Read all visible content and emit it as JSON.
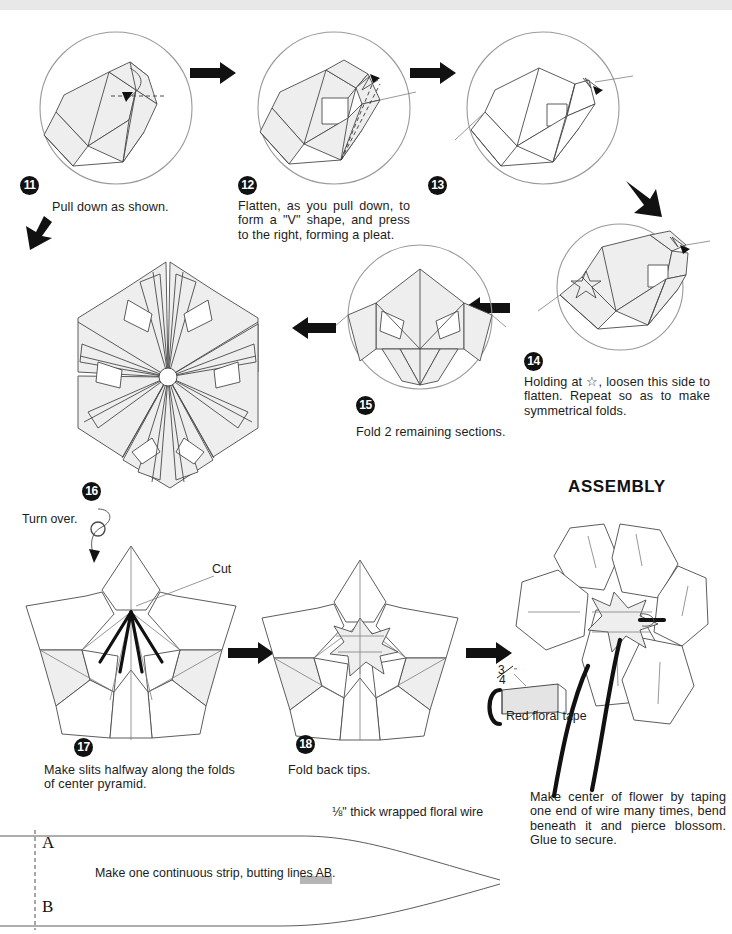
{
  "document": {
    "title": "Origami flower folding instructions — steps 11 to 18 and assembly"
  },
  "steps": [
    {
      "id": "11",
      "number": "11",
      "caption": "Pull down as shown."
    },
    {
      "id": "12",
      "number": "12",
      "caption": "Flatten, as you pull down, to form a \"V\" shape, and press to the right, forming a pleat."
    },
    {
      "id": "13",
      "number": "13",
      "caption": ""
    },
    {
      "id": "14",
      "number": "14",
      "caption": "Holding at ☆, loosen this side to flatten. Repeat so as to make symmetrical folds."
    },
    {
      "id": "15",
      "number": "15",
      "caption": "Fold 2 remaining sections."
    },
    {
      "id": "16",
      "number": "16",
      "caption": ""
    },
    {
      "id": "17",
      "number": "17",
      "caption": "Make slits halfway along the folds of center pyramid."
    },
    {
      "id": "18",
      "number": "18",
      "caption": "Fold back tips."
    }
  ],
  "annotations": {
    "turn_over": "Turn over.",
    "cut": "Cut",
    "star_symbol": "☆",
    "assembly_heading": "ASSEMBLY",
    "tape_label": "Red floral tape",
    "tape_width": "3/4\"",
    "tape_width_numerator": "3",
    "tape_width_denominator": "4",
    "tape_width_unit": "\"",
    "wire_label": "⅛\" thick wrapped floral wire",
    "assembly_caption": "Make center of flower by taping one end of wire many times, bend beneath it and pierce blossom. Glue to secure."
  },
  "template": {
    "line_a": "A",
    "line_b": "B",
    "strip_caption": "Make one continuous strip, butting lines AB."
  },
  "colors": {
    "paper_fill": "#eeeeee",
    "paper_stroke": "#4a4a4a",
    "circle_stroke": "#9a9a9a",
    "ink": "#111111",
    "page_background": "#ffffff"
  }
}
